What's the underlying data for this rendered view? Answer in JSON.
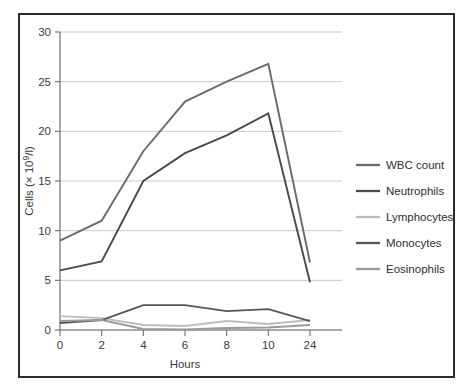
{
  "figure": {
    "frame_color": "#2b2b2b",
    "background": "#ffffff"
  },
  "chart_data": {
    "type": "line",
    "title": "",
    "xlabel": "Hours",
    "ylabel": "Cells (× 10⁹/l)",
    "categories": [
      "0",
      "2",
      "4",
      "6",
      "8",
      "10",
      "24"
    ],
    "x": [
      0,
      2,
      4,
      6,
      8,
      10,
      24
    ],
    "ylim": [
      0,
      30
    ],
    "yticks": [
      0,
      5,
      10,
      15,
      20,
      25,
      30
    ],
    "ytick_labels": [
      "0",
      "5",
      "10",
      "15",
      "20",
      "25",
      "30"
    ],
    "xtick_labels": [
      "0",
      "2",
      "4",
      "6",
      "8",
      "10",
      "24"
    ],
    "grid": "horizontal",
    "legend_position": "right",
    "series": [
      {
        "name": "WBC count",
        "color": "#6b6b6b",
        "width": 1.9,
        "values": [
          9.0,
          11.0,
          18.0,
          23.0,
          25.0,
          26.8,
          6.8
        ]
      },
      {
        "name": "Neutrophils",
        "color": "#4a4a4a",
        "width": 1.9,
        "values": [
          6.0,
          6.9,
          15.0,
          17.8,
          19.6,
          21.8,
          4.8
        ]
      },
      {
        "name": "Lymphocytes",
        "color": "#bdbdbd",
        "width": 1.9,
        "values": [
          1.4,
          1.2,
          0.5,
          0.4,
          0.9,
          0.6,
          1.0
        ]
      },
      {
        "name": "Monocytes",
        "color": "#555555",
        "width": 1.9,
        "values": [
          0.7,
          1.0,
          2.5,
          2.5,
          1.9,
          2.1,
          0.9
        ]
      },
      {
        "name": "Eosinophils",
        "color": "#9a9a9a",
        "width": 1.9,
        "values": [
          0.9,
          1.0,
          0.1,
          0.05,
          0.2,
          0.25,
          0.5
        ]
      }
    ]
  },
  "legend": {
    "entries": [
      {
        "label": "WBC count"
      },
      {
        "label": "Neutrophils"
      },
      {
        "label": "Lymphocytes"
      },
      {
        "label": "Monocytes"
      },
      {
        "label": "Eosinophils"
      }
    ]
  }
}
